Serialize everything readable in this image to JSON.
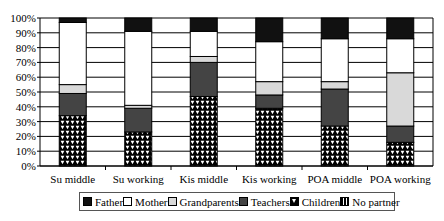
{
  "chart_data": {
    "type": "bar",
    "stacked": true,
    "percent": true,
    "title": "",
    "xlabel": "",
    "ylabel": "",
    "ylim": [
      0,
      100
    ],
    "yticks": [
      "0%",
      "10%",
      "20%",
      "30%",
      "40%",
      "50%",
      "60%",
      "70%",
      "80%",
      "90%",
      "100%"
    ],
    "grid": true,
    "legend_position": "bottom",
    "categories": [
      "Su middle",
      "Su working",
      "Kis middle",
      "Kis working",
      "POA middle",
      "POA working"
    ],
    "series": [
      {
        "name": "Children",
        "values": [
          34,
          23,
          47,
          39,
          27,
          16
        ],
        "color": "#000000",
        "pattern": "triangles"
      },
      {
        "name": "Teachers",
        "values": [
          15,
          16,
          23,
          9,
          25,
          11
        ],
        "color": "#444444"
      },
      {
        "name": "Grandparents",
        "values": [
          6,
          2,
          4,
          9,
          5,
          36
        ],
        "color": "#d9d9d9"
      },
      {
        "name": "Mother",
        "values": [
          42,
          50,
          17,
          27,
          29,
          23
        ],
        "color": "#ffffff"
      },
      {
        "name": "Father",
        "values": [
          3,
          9,
          9,
          16,
          14,
          14
        ],
        "color": "#111111"
      },
      {
        "name": "No partner",
        "values": [
          0,
          0,
          0,
          0,
          0,
          0
        ],
        "color": "#888888",
        "pattern": "vertical-stripes"
      }
    ]
  },
  "legend": {
    "items": [
      {
        "label": "Father",
        "swatch": "solid-black"
      },
      {
        "label": "Mother",
        "swatch": "white"
      },
      {
        "label": "Grandparents",
        "swatch": "light-gray"
      },
      {
        "label": "Teachers",
        "swatch": "dark-gray"
      },
      {
        "label": "Children",
        "swatch": "triangles"
      },
      {
        "label": "No partner",
        "swatch": "stripes"
      }
    ]
  }
}
